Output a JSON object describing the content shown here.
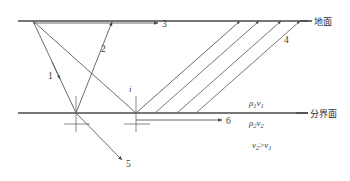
{
  "figure": {
    "surface_label": "地面",
    "interface_label": "分界面",
    "ray_labels": {
      "direct_wave": "1",
      "reflected_wave": "2",
      "surface_wave": "3",
      "head_wave": "4",
      "transmitted_wave": "5",
      "refracted_along_interface": "6"
    },
    "angle_label": "i",
    "upper_layer": {
      "density": "ρ",
      "density_sub": "1",
      "velocity": "v",
      "velocity_sub": "1"
    },
    "lower_layer": {
      "density": "ρ",
      "density_sub": "2",
      "velocity": "v",
      "velocity_sub": "2"
    },
    "velocity_condition": {
      "left_var": "v",
      "left_sub": "2",
      "operator": ">",
      "right_var": "v",
      "right_sub": "1"
    },
    "colors": {
      "line": "#5a5a5a",
      "boundary": "#4a4a4a",
      "text": "#3a3a3a",
      "background": "#ffffff"
    }
  }
}
